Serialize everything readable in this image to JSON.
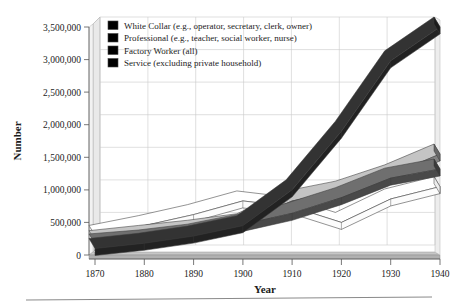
{
  "chart_data": {
    "type": "line",
    "title": "",
    "xlabel": "Year",
    "ylabel": "Number",
    "x": [
      1870,
      1880,
      1890,
      1900,
      1910,
      1920,
      1930,
      1940
    ],
    "xtick_labels": [
      "1870",
      "1880",
      "1890",
      "1900",
      "1910",
      "1920",
      "1930",
      "1940"
    ],
    "ytick_labels": [
      "0",
      "500,000",
      "1,000,000",
      "1,500,000",
      "2,000,000",
      "2,500,000",
      "3,000,000",
      "3,500,000"
    ],
    "ytick_values": [
      0,
      500000,
      1000000,
      1500000,
      2000000,
      2500000,
      3000000,
      3500000
    ],
    "xlim": [
      1870,
      1940
    ],
    "ylim": [
      0,
      3500000
    ],
    "grid": true,
    "legend_position": "top-left-inside",
    "style": "3d-ribbon",
    "series": [
      {
        "name": "White Collar (e.g., operator, secretary, clerk, owner)",
        "short": "White Collar",
        "color": "#2b2b2b",
        "values": [
          100000,
          180000,
          290000,
          450000,
          1000000,
          1900000,
          2980000,
          3500000
        ]
      },
      {
        "name": "Professional (e.g., teacher, social worker, nurse)",
        "short": "Professional",
        "color": "#5e5e5e",
        "values": [
          170000,
          230000,
          320000,
          470000,
          640000,
          880000,
          1180000,
          1320000
        ]
      },
      {
        "name": "Factory Worker (all)",
        "short": "Factory Worker",
        "color": "#a6a6a6",
        "values": [
          220000,
          300000,
          380000,
          480000,
          830000,
          980000,
          1230000,
          1550000
        ]
      },
      {
        "name": "Service (excluding private household)",
        "short": "Service",
        "color": "#ffffff",
        "values": [
          300000,
          450000,
          620000,
          830000,
          740000,
          500000,
          860000,
          1050000
        ]
      }
    ]
  },
  "axes": {
    "ylabel": "Number",
    "xlabel": "Year"
  },
  "legend": {
    "items": [
      {
        "label": "White Collar (e.g., operator, secretary, clerk, owner)",
        "color": "#2b2b2b"
      },
      {
        "label": "Professional (e.g., teacher, social worker, nurse)",
        "color": "#5e5e5e"
      },
      {
        "label": "Factory Worker (all)",
        "color": "#a6a6a6"
      },
      {
        "label": "Service (excluding private household)",
        "color": "#ffffff"
      }
    ]
  },
  "colors": {
    "white_collar": "#2b2b2b",
    "professional": "#5e5e5e",
    "factory_worker": "#a6a6a6",
    "service": "#ffffff",
    "grid": "#c9c9c9",
    "axis": "#555555",
    "wall": "#e8e8e8",
    "floor": "#bcbcbc"
  }
}
